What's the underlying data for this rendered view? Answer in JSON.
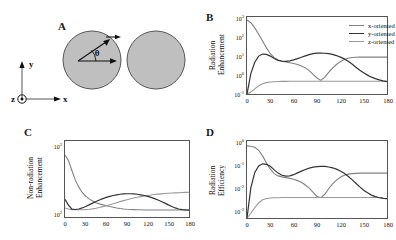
{
  "figure": {
    "panels": [
      {
        "letter": "A"
      },
      {
        "letter": "B"
      },
      {
        "letter": "C"
      },
      {
        "letter": "D"
      }
    ]
  },
  "panel_a": {
    "letter": "A",
    "angle_symbol": "θ",
    "axis_x_label": "x",
    "axis_y_label": "y",
    "axis_z_label": "z",
    "sphere_fill": "#bfbfbf",
    "sphere_stroke": "#555555",
    "description": "Two gray spheres (nanoparticle dimer) with a dipole arrow at angle theta from the x-axis; coordinate triad with y up, x right, z out of page."
  },
  "colors": {
    "x_oriented": "#808080",
    "y_oriented": "#333333",
    "z_oriented": "#999999",
    "axis": "#555555",
    "text": "#111111"
  },
  "legend": {
    "entries": [
      "x-oriented",
      "y-oriented",
      "z-oriented"
    ]
  },
  "chart_data": [
    {
      "id": "panel_b",
      "type": "line",
      "panel_letter": "B",
      "title": "",
      "xlabel": "",
      "ylabel": "Radiation Enhancement",
      "ylabel_lines": [
        "Radiation",
        "Enhancement"
      ],
      "xlim": [
        0,
        180
      ],
      "ylim": [
        0.1,
        3000
      ],
      "yscale": "log",
      "grid": false,
      "legend_position": "top-right",
      "xticks": [
        0,
        30,
        60,
        90,
        120,
        150,
        180
      ],
      "xticklabels": [
        "0",
        "30",
        "60",
        "90",
        "120",
        "150",
        "180"
      ],
      "yticks": [
        0.1,
        1,
        10,
        100,
        1000
      ],
      "yticklabels": [
        "10-1",
        "100",
        "101",
        "102",
        "103"
      ],
      "x": [
        0,
        5,
        10,
        15,
        20,
        25,
        30,
        35,
        40,
        45,
        50,
        55,
        60,
        65,
        70,
        75,
        80,
        85,
        90,
        95,
        100,
        105,
        110,
        115,
        120,
        125,
        130,
        135,
        140,
        145,
        150,
        155,
        160,
        165,
        170,
        175,
        180
      ],
      "series": [
        {
          "name": "x-oriented",
          "color": "#808080",
          "values": [
            2000,
            1400,
            700,
            300,
            120,
            48,
            22,
            13,
            9.5,
            8.0,
            7.2,
            6.6,
            6.0,
            5.2,
            4.3,
            3.3,
            2.3,
            1.4,
            0.85,
            0.62,
            0.95,
            1.8,
            3.2,
            5.2,
            7.6,
            10.0,
            12.0,
            13.2,
            13.8,
            14.0,
            14.0,
            14.0,
            14.0,
            14.0,
            14.0,
            14.0,
            14.0
          ]
        },
        {
          "name": "y-oriented",
          "color": "#333333",
          "values": [
            0.1,
            1.6,
            7.0,
            16.0,
            21.0,
            20.0,
            16.0,
            11.5,
            9.0,
            8.0,
            7.8,
            8.4,
            9.6,
            11.5,
            13.8,
            16.5,
            19.5,
            22.0,
            23.6,
            24.0,
            23.4,
            22.0,
            20.0,
            17.2,
            14.0,
            11.0,
            8.0,
            5.5,
            3.6,
            2.4,
            1.7,
            1.25,
            0.95,
            0.78,
            0.66,
            0.58,
            0.53
          ]
        },
        {
          "name": "z-oriented",
          "color": "#999999",
          "values": [
            0.1,
            0.13,
            0.2,
            0.3,
            0.4,
            0.46,
            0.5,
            0.52,
            0.53,
            0.54,
            0.545,
            0.55,
            0.55,
            0.55,
            0.55,
            0.55,
            0.55,
            0.55,
            0.55,
            0.55,
            0.55,
            0.55,
            0.55,
            0.55,
            0.55,
            0.55,
            0.55,
            0.55,
            0.55,
            0.55,
            0.55,
            0.55,
            0.55,
            0.55,
            0.55,
            0.55,
            0.55
          ]
        }
      ]
    },
    {
      "id": "panel_c",
      "type": "line",
      "panel_letter": "C",
      "title": "",
      "xlabel": "",
      "ylabel": "Non-radiation Enhancement",
      "ylabel_lines": [
        "Non-radiation",
        "Enhancement"
      ],
      "xlim": [
        0,
        180
      ],
      "ylim": [
        100,
        3000
      ],
      "yscale": "log",
      "grid": false,
      "legend_position": "none",
      "xticks": [
        0,
        30,
        60,
        90,
        120,
        150,
        180
      ],
      "xticklabels": [
        "0",
        "30",
        "60",
        "90",
        "120",
        "150",
        "180"
      ],
      "yticks": [
        100,
        1000
      ],
      "yticklabels": [
        "102",
        "103"
      ],
      "x": [
        0,
        5,
        10,
        15,
        20,
        25,
        30,
        35,
        40,
        45,
        50,
        55,
        60,
        65,
        70,
        75,
        80,
        85,
        90,
        95,
        100,
        105,
        110,
        115,
        120,
        125,
        130,
        135,
        140,
        145,
        150,
        155,
        160,
        165,
        170,
        175,
        180
      ],
      "series": [
        {
          "name": "x-oriented",
          "color": "#808080",
          "values": [
            1600,
            1250,
            800,
            520,
            380,
            300,
            255,
            225,
            205,
            190,
            180,
            172,
            166,
            160,
            155,
            150,
            146,
            143,
            141,
            140,
            139,
            138,
            138,
            137,
            137,
            137,
            137,
            137,
            137,
            137,
            137,
            137,
            137,
            137,
            137,
            137,
            137
          ]
        },
        {
          "name": "y-oriented",
          "color": "#333333",
          "values": [
            220,
            170,
            142,
            140,
            143,
            150,
            160,
            172,
            186,
            200,
            214,
            228,
            240,
            252,
            262,
            270,
            277,
            281,
            283,
            283,
            281,
            277,
            270,
            262,
            252,
            240,
            228,
            214,
            200,
            186,
            172,
            160,
            150,
            143,
            139,
            137,
            136
          ]
        },
        {
          "name": "z-oriented",
          "color": "#999999",
          "values": [
            150,
            143,
            139,
            138,
            138,
            138,
            139,
            141,
            144,
            148,
            153,
            159,
            166,
            173,
            181,
            190,
            199,
            208,
            217,
            226,
            234,
            242,
            249,
            256,
            262,
            268,
            273,
            278,
            282,
            286,
            289,
            292,
            295,
            297,
            299,
            301,
            302
          ]
        }
      ]
    },
    {
      "id": "panel_d",
      "type": "line",
      "panel_letter": "D",
      "title": "",
      "xlabel": "",
      "ylabel": "Radiation Efficiency",
      "ylabel_lines": [
        "Radiation",
        "Efficiency"
      ],
      "xlim": [
        0,
        180
      ],
      "ylim": [
        0.0005,
        1.0
      ],
      "yscale": "log",
      "grid": false,
      "legend_position": "none",
      "xticks": [
        0,
        30,
        60,
        90,
        120,
        150,
        180
      ],
      "xticklabels": [
        "0",
        "30",
        "60",
        "90",
        "120",
        "150",
        "180"
      ],
      "yticks": [
        0.001,
        0.01,
        0.1,
        1
      ],
      "yticklabels": [
        "10-3",
        "10-2",
        "10-1",
        "100"
      ],
      "x": [
        0,
        5,
        10,
        15,
        20,
        25,
        30,
        35,
        40,
        45,
        50,
        55,
        60,
        65,
        70,
        75,
        80,
        85,
        90,
        95,
        100,
        105,
        110,
        115,
        120,
        125,
        130,
        135,
        140,
        145,
        150,
        155,
        160,
        165,
        170,
        175,
        180
      ],
      "series": [
        {
          "name": "x-oriented",
          "color": "#808080",
          "values": [
            0.62,
            0.6,
            0.54,
            0.4,
            0.23,
            0.115,
            0.062,
            0.04,
            0.032,
            0.029,
            0.027,
            0.025,
            0.023,
            0.02,
            0.017,
            0.013,
            0.0095,
            0.0062,
            0.0042,
            0.0037,
            0.0052,
            0.009,
            0.0145,
            0.021,
            0.028,
            0.034,
            0.038,
            0.04,
            0.041,
            0.042,
            0.042,
            0.042,
            0.042,
            0.042,
            0.042,
            0.042,
            0.042
          ]
        },
        {
          "name": "y-oriented",
          "color": "#333333",
          "values": [
            0.0005,
            0.01,
            0.045,
            0.085,
            0.105,
            0.1,
            0.082,
            0.058,
            0.042,
            0.034,
            0.031,
            0.032,
            0.036,
            0.043,
            0.051,
            0.06,
            0.069,
            0.076,
            0.08,
            0.082,
            0.081,
            0.077,
            0.071,
            0.062,
            0.052,
            0.041,
            0.031,
            0.022,
            0.0155,
            0.0108,
            0.0078,
            0.006,
            0.0048,
            0.0041,
            0.0037,
            0.0035,
            0.0034
          ]
        },
        {
          "name": "z-oriented",
          "color": "#999999",
          "values": [
            0.0005,
            0.0008,
            0.0014,
            0.0022,
            0.003,
            0.0034,
            0.0036,
            0.0037,
            0.0037,
            0.0038,
            0.0038,
            0.0038,
            0.0038,
            0.0038,
            0.0038,
            0.0038,
            0.0038,
            0.0038,
            0.0038,
            0.0038,
            0.0038,
            0.0038,
            0.0038,
            0.0038,
            0.0038,
            0.0038,
            0.0038,
            0.0038,
            0.0038,
            0.0038,
            0.0038,
            0.0038,
            0.0038,
            0.0038,
            0.0038,
            0.0038
          ]
        }
      ]
    }
  ]
}
